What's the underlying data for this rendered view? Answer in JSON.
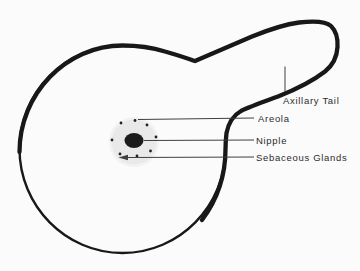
{
  "figure": {
    "labels": {
      "axillary_tail": "Axillary Tail",
      "areola": "Areola",
      "nipple": "Nipple",
      "sebaceous_glands": "Sebaceous Glands"
    },
    "colors": {
      "background": "#fbfbfb",
      "outline_color": "#181818",
      "line_color": "#3f3f3f",
      "text_color": "#2b2b2b",
      "areola_fill": "#e9e9e9",
      "areola_outer_fill": "#f2f2f2",
      "nipple_fill": "#1c1c1c",
      "dot_color": "#222222"
    }
  }
}
